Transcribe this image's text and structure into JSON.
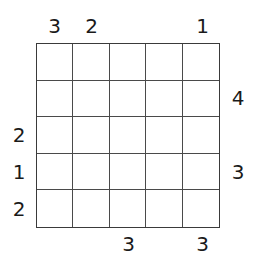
{
  "puzzle": {
    "type": "skyscrapers-grid",
    "size": 5,
    "grid_values": [
      [
        "",
        "",
        "",
        "",
        ""
      ],
      [
        "",
        "",
        "",
        "",
        ""
      ],
      [
        "",
        "",
        "",
        "",
        ""
      ],
      [
        "",
        "",
        "",
        "",
        ""
      ],
      [
        "",
        "",
        "",
        "",
        ""
      ]
    ],
    "clues": {
      "top": [
        "3",
        "2",
        "",
        "",
        "1"
      ],
      "bottom": [
        "",
        "",
        "3",
        "",
        "3"
      ],
      "left": [
        "",
        "",
        "2",
        "1",
        "2"
      ],
      "right": [
        "",
        "4",
        "",
        "3",
        ""
      ]
    },
    "colors": {
      "grid_line": "#4a4a4a",
      "grid_border": "#3a3a3a",
      "clue_text": "#1a1a1a",
      "background": "#ffffff"
    }
  }
}
